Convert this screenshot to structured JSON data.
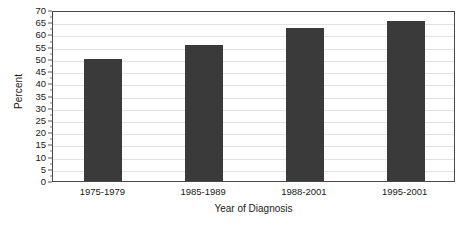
{
  "chart_data": {
    "type": "bar",
    "title": "",
    "xlabel": "Year of Diagnosis",
    "ylabel": "Percent",
    "categories": [
      "1975-1979",
      "1985-1989",
      "1988-2001",
      "1995-2001"
    ],
    "values": [
      50,
      55.5,
      62.5,
      65.3
    ],
    "series": [
      {
        "name": "Percent",
        "values": [
          50,
          55.5,
          62.5,
          65.3
        ]
      }
    ],
    "ylim": [
      0,
      70
    ],
    "ytick_values": [
      0,
      5,
      10,
      15,
      20,
      25,
      30,
      35,
      40,
      45,
      50,
      55,
      60,
      65,
      70
    ],
    "ytick_labels": [
      "0",
      "5",
      "10",
      "15",
      "20",
      "25",
      "30",
      "35",
      "40",
      "45",
      "50",
      "55",
      "60",
      "65",
      "70"
    ],
    "grid": true,
    "grid_axis": "y",
    "legend": false,
    "legend_position": "none",
    "bar_color": "#3a3a3a",
    "grid_color": "#e2e2e6",
    "axis_color": "#4a4a4a",
    "background_color": "#ffffff",
    "text_color": "#1a1a1a"
  }
}
